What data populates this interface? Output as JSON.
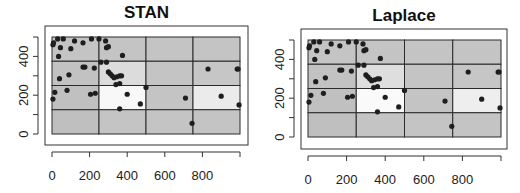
{
  "chart_data": [
    {
      "type": "heatmap",
      "title": "STAN",
      "xlabel": "",
      "ylabel": "",
      "xlim": [
        0,
        1000
      ],
      "ylim": [
        0,
        500
      ],
      "x_ticks": [
        0,
        200,
        400,
        600,
        800
      ],
      "y_ticks": [
        0,
        200,
        400
      ],
      "x_breaks": [
        0,
        250,
        500,
        750,
        1000
      ],
      "y_breaks": [
        0,
        125,
        250,
        375,
        500
      ],
      "cell_shades": [
        [
          "#c4c4c4",
          "#c4c4c4",
          "#c4c4c4",
          "#c4c4c4"
        ],
        [
          "#c2c2c2",
          "#dcdcdc",
          "#c4c4c4",
          "#c6c6c6"
        ],
        [
          "#c0c0c0",
          "#f8f8f8",
          "#c4c4c4",
          "#ebebeb"
        ],
        [
          "#bfbfbf",
          "#c4c4c4",
          "#c4c4c4",
          "#c4c4c4"
        ]
      ],
      "points": [
        [
          5,
          460
        ],
        [
          8,
          470
        ],
        [
          30,
          490
        ],
        [
          60,
          490
        ],
        [
          45,
          445
        ],
        [
          100,
          440
        ],
        [
          35,
          400
        ],
        [
          120,
          480
        ],
        [
          165,
          470
        ],
        [
          210,
          490
        ],
        [
          250,
          490
        ],
        [
          285,
          480
        ],
        [
          290,
          445
        ],
        [
          300,
          450
        ],
        [
          260,
          370
        ],
        [
          290,
          370
        ],
        [
          375,
          405
        ],
        [
          165,
          345
        ],
        [
          175,
          345
        ],
        [
          225,
          340
        ],
        [
          90,
          305
        ],
        [
          40,
          285
        ],
        [
          300,
          320
        ],
        [
          310,
          310
        ],
        [
          320,
          300
        ],
        [
          330,
          290
        ],
        [
          345,
          295
        ],
        [
          360,
          300
        ],
        [
          370,
          300
        ],
        [
          360,
          260
        ],
        [
          340,
          255
        ],
        [
          15,
          215
        ],
        [
          5,
          180
        ],
        [
          80,
          225
        ],
        [
          205,
          205
        ],
        [
          230,
          210
        ],
        [
          400,
          205
        ],
        [
          470,
          155
        ],
        [
          360,
          130
        ],
        [
          500,
          240
        ],
        [
          710,
          185
        ],
        [
          900,
          195
        ],
        [
          830,
          335
        ],
        [
          985,
          335
        ],
        [
          990,
          335
        ],
        [
          995,
          150
        ],
        [
          745,
          55
        ]
      ]
    },
    {
      "type": "heatmap",
      "title": "Laplace",
      "xlabel": "",
      "ylabel": "",
      "xlim": [
        0,
        1000
      ],
      "ylim": [
        0,
        500
      ],
      "x_ticks": [
        0,
        200,
        400,
        600,
        800
      ],
      "y_ticks": [
        0,
        200,
        400
      ],
      "x_breaks": [
        0,
        250,
        500,
        750,
        1000
      ],
      "y_breaks": [
        0,
        125,
        250,
        375,
        500
      ],
      "cell_shades": [
        [
          "#c4c4c4",
          "#c4c4c4",
          "#c4c4c4",
          "#c4c4c4"
        ],
        [
          "#c2c2c2",
          "#dedede",
          "#c4c4c4",
          "#c6c6c6"
        ],
        [
          "#c0c0c0",
          "#fafafa",
          "#c4c4c4",
          "#eeeeee"
        ],
        [
          "#bfbfbf",
          "#c4c4c4",
          "#c4c4c4",
          "#c4c4c4"
        ]
      ],
      "points": [
        [
          5,
          460
        ],
        [
          8,
          470
        ],
        [
          30,
          490
        ],
        [
          60,
          490
        ],
        [
          45,
          445
        ],
        [
          100,
          440
        ],
        [
          35,
          400
        ],
        [
          120,
          480
        ],
        [
          165,
          470
        ],
        [
          210,
          490
        ],
        [
          250,
          490
        ],
        [
          285,
          480
        ],
        [
          290,
          445
        ],
        [
          300,
          450
        ],
        [
          260,
          370
        ],
        [
          290,
          370
        ],
        [
          375,
          405
        ],
        [
          165,
          345
        ],
        [
          175,
          345
        ],
        [
          225,
          340
        ],
        [
          90,
          305
        ],
        [
          40,
          285
        ],
        [
          300,
          320
        ],
        [
          310,
          310
        ],
        [
          320,
          300
        ],
        [
          330,
          290
        ],
        [
          345,
          295
        ],
        [
          360,
          300
        ],
        [
          370,
          300
        ],
        [
          360,
          260
        ],
        [
          340,
          255
        ],
        [
          15,
          215
        ],
        [
          5,
          180
        ],
        [
          80,
          225
        ],
        [
          205,
          205
        ],
        [
          230,
          210
        ],
        [
          400,
          205
        ],
        [
          470,
          155
        ],
        [
          360,
          130
        ],
        [
          500,
          240
        ],
        [
          710,
          185
        ],
        [
          900,
          195
        ],
        [
          830,
          335
        ],
        [
          985,
          335
        ],
        [
          990,
          335
        ],
        [
          995,
          150
        ],
        [
          745,
          55
        ]
      ]
    }
  ],
  "panels": [
    {
      "title": "STAN"
    },
    {
      "title": "Laplace"
    }
  ]
}
